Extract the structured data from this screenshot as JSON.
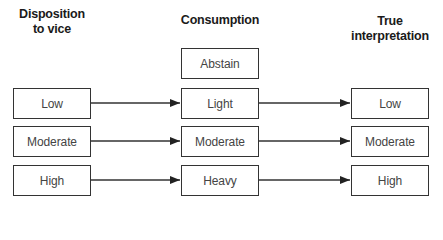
{
  "diagram": {
    "columns": [
      {
        "id": "disposition",
        "header_line1": "Disposition",
        "header_line2": "to vice"
      },
      {
        "id": "consumption",
        "header_line1": "Consumption",
        "header_line2": ""
      },
      {
        "id": "true_interpretation",
        "header_line1": "True",
        "header_line2": "interpretation"
      }
    ],
    "disposition": [
      "Low",
      "Moderate",
      "High"
    ],
    "consumption": [
      "Abstain",
      "Light",
      "Moderate",
      "Heavy"
    ],
    "true_interpretation": [
      "Low",
      "Moderate",
      "High"
    ],
    "edges": [
      {
        "from": "disposition.Low",
        "to": "consumption.Light"
      },
      {
        "from": "disposition.Moderate",
        "to": "consumption.Moderate"
      },
      {
        "from": "disposition.High",
        "to": "consumption.Heavy"
      },
      {
        "from": "consumption.Light",
        "to": "true_interpretation.Low"
      },
      {
        "from": "consumption.Moderate",
        "to": "true_interpretation.Moderate"
      },
      {
        "from": "consumption.Heavy",
        "to": "true_interpretation.High"
      }
    ],
    "colors": {
      "stroke": "#333333",
      "text": "#444444",
      "header": "#1a1a1a"
    }
  }
}
